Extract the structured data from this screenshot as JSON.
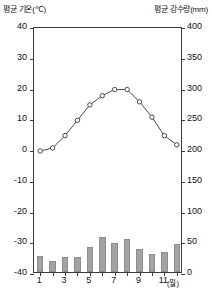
{
  "header": {
    "left_label": "평균 기온(℃)",
    "right_label": "평균 강수량(mm)"
  },
  "axes": {
    "x_unit": "(월)",
    "x_tick_labels": [
      "1",
      "3",
      "5",
      "7",
      "9",
      "11"
    ]
  },
  "chart_data": {
    "type": "bar",
    "title": "",
    "subtitle": "",
    "categories": [
      "1",
      "2",
      "3",
      "4",
      "5",
      "6",
      "7",
      "8",
      "9",
      "10",
      "11",
      "12"
    ],
    "x": [
      1,
      2,
      3,
      4,
      5,
      6,
      7,
      8,
      9,
      10,
      11,
      12
    ],
    "xlabel": "(월)",
    "grid": false,
    "legend_position": "none",
    "series": [
      {
        "name": "평균 강수량",
        "type": "bar",
        "unit": "mm",
        "axis": "right",
        "color": "#a3a3a3",
        "values": [
          26,
          18,
          25,
          24,
          40,
          57,
          47,
          53,
          38,
          29,
          33,
          45
        ]
      },
      {
        "name": "평균 기온",
        "type": "line",
        "unit": "℃",
        "axis": "left",
        "color": "#4a4a4a",
        "marker": "open-circle",
        "values": [
          0,
          1,
          5,
          10,
          15,
          18,
          20,
          20,
          16,
          11,
          5,
          2
        ]
      }
    ],
    "left_axis": {
      "label": "평균 기온(℃)",
      "unit": "℃",
      "ylim": [
        -40,
        40
      ],
      "tick_step": 10,
      "tick_labels": [
        "40",
        "30",
        "20",
        "10",
        "0",
        "-10",
        "-20",
        "-30",
        "-40"
      ],
      "tick_values": [
        40,
        30,
        20,
        10,
        0,
        -10,
        -20,
        -30,
        -40
      ]
    },
    "right_axis": {
      "label": "평균 강수량(mm)",
      "unit": "mm",
      "ylim": [
        0,
        400
      ],
      "tick_step": 50,
      "tick_labels": [
        "400",
        "350",
        "300",
        "250",
        "200",
        "150",
        "100",
        "50",
        "0"
      ],
      "tick_values": [
        400,
        350,
        300,
        250,
        200,
        150,
        100,
        50,
        0
      ]
    }
  }
}
